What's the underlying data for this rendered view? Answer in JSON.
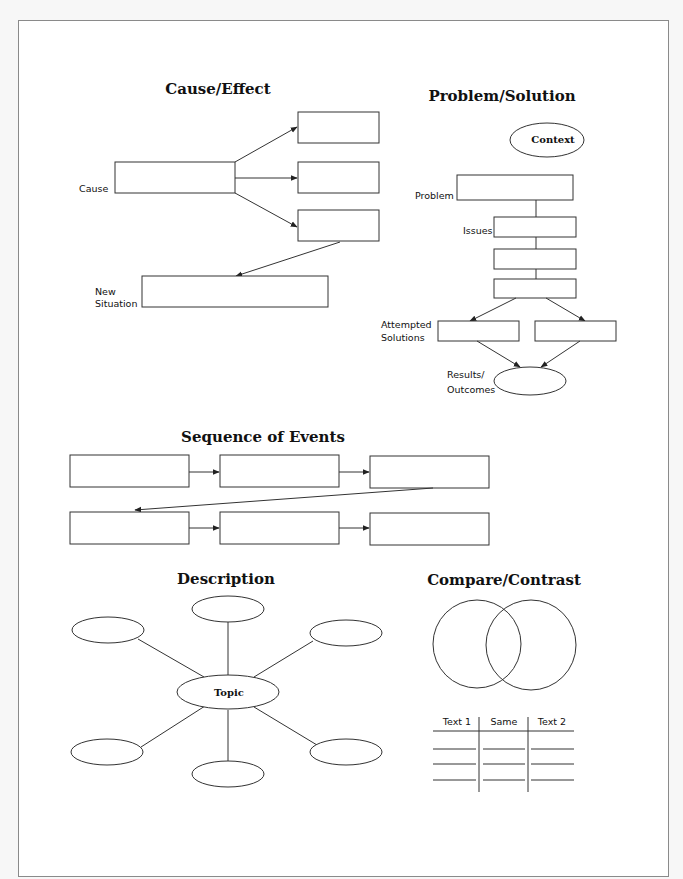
{
  "cause_effect": {
    "title": "Cause/Effect",
    "cause_label": "Cause",
    "new_situation_label_line1": "New",
    "new_situation_label_line2": "Situation"
  },
  "problem_solution": {
    "title": "Problem/Solution",
    "context_label": "Context",
    "problem_label": "Problem",
    "issues_label": "Issues",
    "attempted_solutions_line1": "Attempted",
    "attempted_solutions_line2": "Solutions",
    "results_line1": "Results/",
    "results_line2": "Outcomes"
  },
  "sequence": {
    "title": "Sequence of Events"
  },
  "description": {
    "title": "Description",
    "topic_label": "Topic"
  },
  "compare_contrast": {
    "title": "Compare/Contrast",
    "table_headers": [
      "Text 1",
      "Same",
      "Text 2"
    ]
  }
}
